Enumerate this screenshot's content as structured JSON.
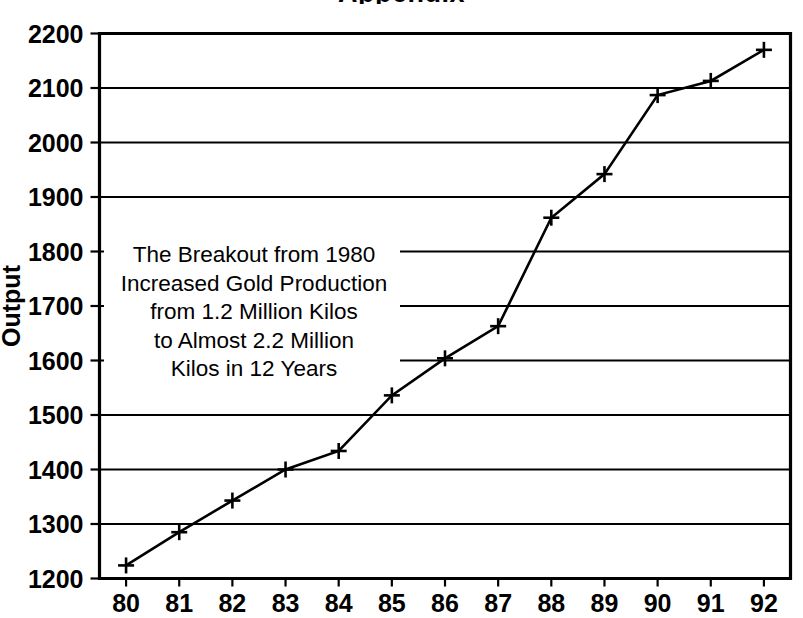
{
  "title_clipped": "Appendix",
  "chart_data": {
    "type": "line",
    "title": "",
    "xlabel": "",
    "ylabel": "Output",
    "categories": [
      "80",
      "81",
      "82",
      "83",
      "84",
      "85",
      "86",
      "87",
      "88",
      "89",
      "90",
      "91",
      "92"
    ],
    "x": [
      80,
      81,
      82,
      83,
      84,
      85,
      86,
      87,
      88,
      89,
      90,
      91,
      92
    ],
    "values": [
      1224,
      1285,
      1343,
      1400,
      1434,
      1536,
      1604,
      1663,
      1862,
      1942,
      2087,
      2113,
      2170
    ],
    "ylim": [
      1200,
      2200
    ],
    "yticks": [
      1200,
      1300,
      1400,
      1500,
      1600,
      1700,
      1800,
      1900,
      2000,
      2100,
      2200
    ],
    "ytick_labels": [
      "1200",
      "1300",
      "1400",
      "1500",
      "1600",
      "1700",
      "1800",
      "1900",
      "2000",
      "2100",
      "2200"
    ],
    "xtick_labels": [
      "80",
      "81",
      "82",
      "83",
      "84",
      "85",
      "86",
      "87",
      "88",
      "89",
      "90",
      "91",
      "92"
    ],
    "grid": true,
    "grid_axis": "y",
    "legend": "none",
    "marker": "plus",
    "line_color": "#000000",
    "marker_color": "#000000",
    "background_color": "#ffffff",
    "annotations": [
      {
        "name": "breakout-note",
        "lines": [
          "The Breakout from 1980",
          "Increased Gold Production",
          "from 1.2 Million Kilos",
          "to Almost 2.2 Million",
          "Kilos in 12 Years"
        ]
      }
    ]
  }
}
